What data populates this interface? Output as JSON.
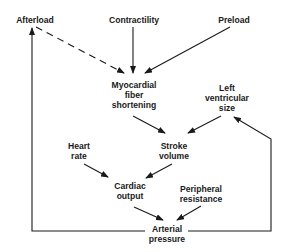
{
  "diagram": {
    "nodes": {
      "afterload": {
        "lines": [
          "Afterload"
        ]
      },
      "contractility": {
        "lines": [
          "Contractility"
        ]
      },
      "preload": {
        "lines": [
          "Preload"
        ]
      },
      "myocardial": {
        "lines": [
          "Myocardial",
          "fiber",
          "shortening"
        ]
      },
      "lv_size": {
        "lines": [
          "Left",
          "ventricular",
          "size"
        ]
      },
      "heart_rate": {
        "lines": [
          "Heart",
          "rate"
        ]
      },
      "stroke_volume": {
        "lines": [
          "Stroke",
          "volume"
        ]
      },
      "cardiac_output": {
        "lines": [
          "Cardiac",
          "output"
        ]
      },
      "peripheral": {
        "lines": [
          "Peripheral",
          "resistance"
        ]
      },
      "arterial": {
        "lines": [
          "Arterial",
          "pressure"
        ]
      }
    },
    "edges": [
      {
        "from": "Afterload",
        "to": "Myocardial fiber shortening",
        "style": "dashed"
      },
      {
        "from": "Contractility",
        "to": "Myocardial fiber shortening",
        "style": "solid"
      },
      {
        "from": "Preload",
        "to": "Myocardial fiber shortening",
        "style": "solid"
      },
      {
        "from": "Myocardial fiber shortening",
        "to": "Stroke volume",
        "style": "solid"
      },
      {
        "from": "Left ventricular size",
        "to": "Stroke volume",
        "style": "solid"
      },
      {
        "from": "Heart rate",
        "to": "Cardiac output",
        "style": "solid"
      },
      {
        "from": "Stroke volume",
        "to": "Cardiac output",
        "style": "solid"
      },
      {
        "from": "Cardiac output",
        "to": "Arterial pressure",
        "style": "solid"
      },
      {
        "from": "Peripheral resistance",
        "to": "Arterial pressure",
        "style": "solid"
      },
      {
        "from": "Arterial pressure",
        "to": "Afterload",
        "style": "solid-feedback"
      },
      {
        "from": "Arterial pressure",
        "to": "Left ventricular size",
        "style": "solid-feedback"
      }
    ],
    "colors": {
      "ink": "#1a1a1a",
      "background": "#ffffff"
    }
  }
}
